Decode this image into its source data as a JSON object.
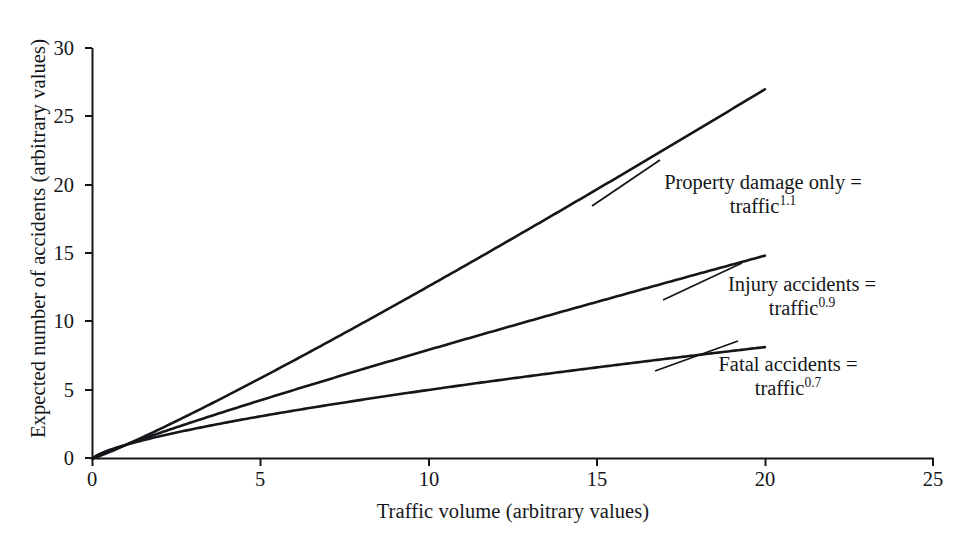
{
  "chart_data": {
    "type": "line",
    "title": "",
    "xlabel": "Traffic volume (arbitrary values)",
    "ylabel": "Expected number of accidents (arbitrary values)",
    "xlim": [
      0,
      25
    ],
    "ylim": [
      0,
      30
    ],
    "xticks": [
      "0",
      "5",
      "10",
      "15",
      "20",
      "25"
    ],
    "xtick_values": [
      0,
      5,
      10,
      15,
      20,
      25
    ],
    "yticks": [
      "0",
      "5",
      "10",
      "15",
      "20",
      "25",
      "30"
    ],
    "ytick_values": [
      0,
      5,
      10,
      15,
      20,
      25,
      30
    ],
    "grid": false,
    "legend": "annotations-inline",
    "x": [
      0,
      1,
      2,
      3,
      4,
      5,
      6,
      7,
      8,
      9,
      10,
      11,
      12,
      13,
      14,
      15,
      16,
      17,
      18,
      19,
      20
    ],
    "series": [
      {
        "name": "Property damage only",
        "formula": "traffic^1.1",
        "exponent": 1.1,
        "values": [
          0,
          1,
          2.14,
          3.35,
          4.59,
          5.87,
          7.18,
          8.51,
          9.85,
          11.22,
          12.59,
          13.98,
          15.38,
          16.79,
          18.21,
          19.64,
          21.08,
          22.53,
          23.98,
          25.44,
          26.91
        ]
      },
      {
        "name": "Injury accidents",
        "formula": "traffic^0.9",
        "exponent": 0.9,
        "values": [
          0,
          1,
          1.87,
          2.69,
          3.48,
          4.26,
          5.02,
          5.77,
          6.5,
          7.22,
          7.94,
          8.65,
          9.36,
          10.06,
          10.75,
          11.44,
          12.13,
          12.81,
          13.48,
          14.16,
          14.83
        ]
      },
      {
        "name": "Fatal accidents",
        "formula": "traffic^0.7",
        "exponent": 0.7,
        "values": [
          0,
          1,
          1.62,
          2.16,
          2.64,
          3.09,
          3.51,
          3.9,
          4.29,
          4.66,
          5.01,
          5.36,
          5.69,
          6.02,
          6.34,
          6.65,
          6.96,
          7.26,
          7.55,
          7.84,
          8.14
        ]
      }
    ],
    "annotations": [
      {
        "id": "property-damage-only",
        "line1": "Property damage only =",
        "line2_base": "traffic",
        "line2_exp": "1.1"
      },
      {
        "id": "injury-accidents",
        "line1": "Injury accidents =",
        "line2_base": "traffic",
        "line2_exp": "0.9"
      },
      {
        "id": "fatal-accidents",
        "line1": "Fatal accidents =",
        "line2_base": "traffic",
        "line2_exp": "0.7"
      }
    ]
  },
  "colors": {
    "background": "#ffffff",
    "axis": "#14161a",
    "curve": "#14161a",
    "text": "#14161a"
  }
}
